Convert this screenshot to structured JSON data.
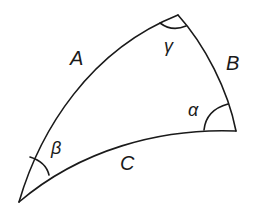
{
  "diagram": {
    "stroke_color": "#1a1a1a",
    "sides": [
      {
        "id": "A",
        "label": "A"
      },
      {
        "id": "B",
        "label": "B"
      },
      {
        "id": "C",
        "label": "C"
      }
    ],
    "angles": [
      {
        "id": "alpha",
        "label": "α"
      },
      {
        "id": "beta",
        "label": "β"
      },
      {
        "id": "gamma",
        "label": "γ"
      }
    ]
  }
}
